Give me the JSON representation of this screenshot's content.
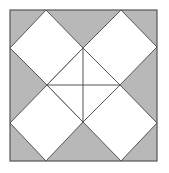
{
  "diagram": {
    "colors": {
      "background": "#ffffff",
      "fill_gray": "#b8b8b8",
      "fill_white": "#ffffff",
      "stroke": "#555555"
    },
    "frame": {
      "x": 10,
      "y": 10,
      "width": 147,
      "height": 151
    },
    "diamonds": [
      {
        "name": "top-left",
        "points": "46,10 83,48 47,85 10,48"
      },
      {
        "name": "top-right",
        "points": "121,10 157,47 120,85 83,48"
      },
      {
        "name": "bottom-left",
        "points": "47,85 83,122 46,161 10,123"
      },
      {
        "name": "bottom-right",
        "points": "120,85 157,123 121,161 83,122"
      }
    ],
    "center_diamond": {
      "points": "83,48 120,85 83,122 47,85"
    },
    "cross_lines": [
      {
        "x1": 83,
        "y1": 48,
        "x2": 83,
        "y2": 122
      },
      {
        "x1": 47,
        "y1": 85,
        "x2": 120,
        "y2": 85
      }
    ]
  }
}
